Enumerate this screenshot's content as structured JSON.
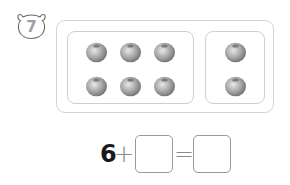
{
  "problem": {
    "number": "7",
    "badge_icon": "bear-face-icon"
  },
  "groups": [
    {
      "name": "left-group",
      "count": 6,
      "item": "blueberry"
    },
    {
      "name": "right-group",
      "count": 2,
      "item": "blueberry"
    }
  ],
  "equation": {
    "first_addend": "6",
    "plus": "+",
    "second_addend": "",
    "equals": "=",
    "sum": ""
  },
  "colors": {
    "frame": "#d4d4d4",
    "answer_box": "#9a9a9a",
    "blueberry": "#9c9c9c",
    "number_text": "#1a1a1a"
  }
}
